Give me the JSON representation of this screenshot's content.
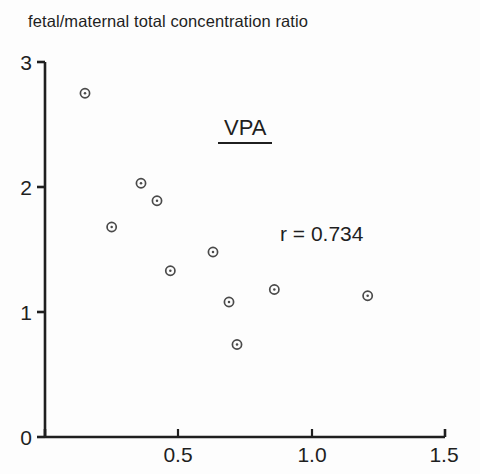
{
  "figure": {
    "title": "fetal/maternal total concentration ratio",
    "background_color": "#fdfdfd",
    "axis_color": "#1f1f1f",
    "marker_color": "#4a4a4a"
  },
  "annotations": {
    "series_label": "VPA",
    "correlation_label": "r = 0.734"
  },
  "axes": {
    "x_ticks": [
      "0.5",
      "1.0",
      "1.5"
    ],
    "y_ticks": [
      "3",
      "2",
      "1",
      "0"
    ]
  },
  "chart_data": {
    "type": "scatter",
    "title": "fetal/maternal total concentration ratio",
    "xlabel": "",
    "ylabel": "fetal/maternal total concentration ratio",
    "xlim": [
      0,
      1.5
    ],
    "ylim": [
      0,
      3
    ],
    "xticks": [
      0.5,
      1.0,
      1.5
    ],
    "yticks": [
      0,
      1,
      2,
      3
    ],
    "grid": false,
    "legend": null,
    "annotations": [
      {
        "text": "VPA",
        "x": 0.77,
        "y": 2.45,
        "underlined": true
      },
      {
        "text": "r = 0.734",
        "x": 1.0,
        "y": 1.62,
        "underlined": false
      }
    ],
    "series": [
      {
        "name": "VPA",
        "marker": "circle-with-center-dot",
        "correlation_r": 0.734,
        "points": [
          {
            "x": 0.15,
            "y": 2.75
          },
          {
            "x": 0.25,
            "y": 1.68
          },
          {
            "x": 0.36,
            "y": 2.03
          },
          {
            "x": 0.42,
            "y": 1.89
          },
          {
            "x": 0.47,
            "y": 1.33
          },
          {
            "x": 0.63,
            "y": 1.48
          },
          {
            "x": 0.69,
            "y": 1.08
          },
          {
            "x": 0.72,
            "y": 0.74
          },
          {
            "x": 0.86,
            "y": 1.18
          },
          {
            "x": 1.21,
            "y": 1.13
          }
        ]
      }
    ]
  }
}
